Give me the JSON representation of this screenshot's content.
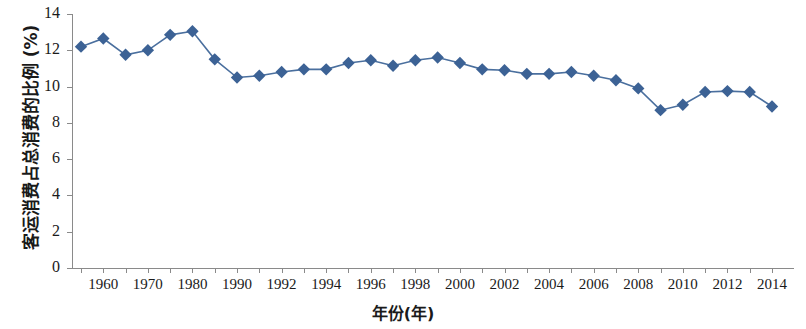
{
  "chart_data": {
    "type": "line",
    "title": "",
    "xlabel": "年份(年)",
    "ylabel": "客运消费占总消费的比例 (%)",
    "ylim": [
      0,
      14
    ],
    "ytick_values": [
      0,
      2,
      4,
      6,
      8,
      10,
      12,
      14
    ],
    "ytick_labels": [
      "0",
      "2",
      "4",
      "6",
      "8",
      "10",
      "12",
      "14"
    ],
    "xtick_labels": [
      "1960",
      "1970",
      "1980",
      "1990",
      "1992",
      "1994",
      "1996",
      "1998",
      "2000",
      "2002",
      "2004",
      "2006",
      "2008",
      "2010",
      "2012",
      "2014"
    ],
    "grid": false,
    "legend": "none",
    "marker": "diamond",
    "series_color": "#3c6295",
    "line_color": "#4a6f9e",
    "axis_color": "#8a8a8a",
    "categories": [
      "1955",
      "1960",
      "1965",
      "1970",
      "1975",
      "1980",
      "1985",
      "1990",
      "1991",
      "1992",
      "1993",
      "1994",
      "1995",
      "1996",
      "1997",
      "1998",
      "1999",
      "2000",
      "2001",
      "2002",
      "2003",
      "2004",
      "2005",
      "2006",
      "2007",
      "2008",
      "2009",
      "2010",
      "2011",
      "2012",
      "2013",
      "2014"
    ],
    "values": [
      12.2,
      12.65,
      11.75,
      12.0,
      12.85,
      13.05,
      11.5,
      10.5,
      10.6,
      10.8,
      10.95,
      10.95,
      11.3,
      11.45,
      11.15,
      11.45,
      11.6,
      11.3,
      10.95,
      10.9,
      10.7,
      10.7,
      10.8,
      10.6,
      10.35,
      9.9,
      8.7,
      9.0,
      9.7,
      9.75,
      9.7,
      8.9
    ],
    "xtick_index_map": [
      1,
      3,
      5,
      7,
      9,
      11,
      13,
      15,
      17,
      19,
      21,
      23,
      25,
      27,
      29,
      31
    ]
  }
}
